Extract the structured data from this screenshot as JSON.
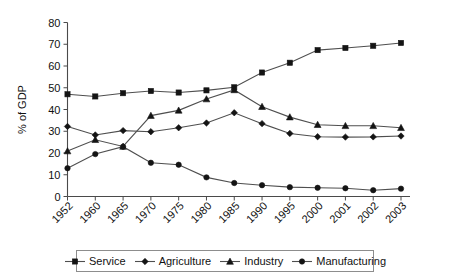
{
  "chart_data": {
    "type": "line",
    "title": "",
    "xlabel": "",
    "ylabel": "% of GDP",
    "ylim": [
      0,
      80
    ],
    "ytick_step": 10,
    "yticks": [
      0,
      10,
      20,
      30,
      40,
      50,
      60,
      70,
      80
    ],
    "grid": false,
    "legend_position": "bottom",
    "categories": [
      "1952",
      "1960",
      "1965",
      "1970",
      "1975",
      "1980",
      "1985",
      "1990",
      "1995",
      "2000",
      "2001",
      "2002",
      "2003"
    ],
    "series": [
      {
        "name": "Service",
        "marker": "square",
        "values": [
          47.0,
          46.0,
          47.5,
          48.5,
          47.8,
          48.8,
          50.2,
          57.0,
          61.5,
          67.3,
          68.3,
          69.3,
          70.6
        ]
      },
      {
        "name": "Agriculture",
        "marker": "diamond",
        "values": [
          32.2,
          28.3,
          30.3,
          29.8,
          31.6,
          33.8,
          38.5,
          33.5,
          29.0,
          27.5,
          27.3,
          27.4,
          27.8
        ]
      },
      {
        "name": "Industry",
        "marker": "triangle",
        "values": [
          20.9,
          26.1,
          23.0,
          37.2,
          39.6,
          44.8,
          49.0,
          41.3,
          36.5,
          33.0,
          32.5,
          32.5,
          31.6
        ]
      },
      {
        "name": "Manufacturing",
        "marker": "circle",
        "values": [
          13.0,
          19.5,
          22.9,
          15.5,
          14.6,
          8.8,
          6.2,
          5.2,
          4.3,
          4.0,
          3.8,
          2.9,
          3.6
        ]
      }
    ]
  },
  "legend": {
    "items": [
      {
        "label": "Service"
      },
      {
        "label": "Agriculture"
      },
      {
        "label": "Industry"
      },
      {
        "label": "Manufacturing"
      }
    ]
  },
  "axes": {
    "y_title": "% of GDP"
  }
}
